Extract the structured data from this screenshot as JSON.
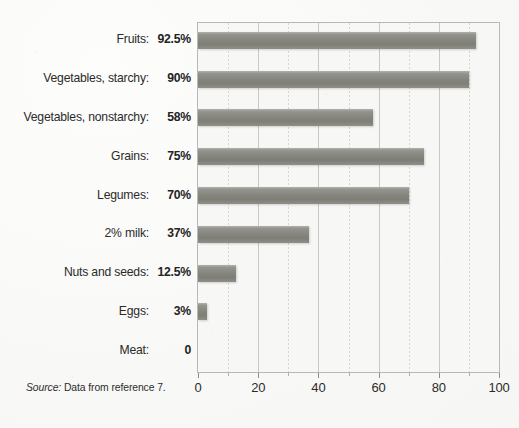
{
  "figure": {
    "source_note_lead": "Source:",
    "source_note_text": " Data from reference 7."
  },
  "axis": {
    "tick_labels": [
      "0",
      "20",
      "40",
      "60",
      "80",
      "100"
    ]
  },
  "chart_data": {
    "type": "bar",
    "orientation": "horizontal",
    "title": "",
    "xlabel": "",
    "ylabel": "",
    "xlim": [
      0,
      100
    ],
    "xticks": [
      0,
      20,
      40,
      60,
      80,
      100
    ],
    "minor_xticks": [
      10,
      30,
      50,
      70,
      90
    ],
    "grid": true,
    "legend": "none",
    "bar_color": "#87877f",
    "plot_background": "#f7f7f5",
    "categories": [
      "Fruits",
      "Vegetables, starchy",
      "Vegetables, nonstarchy",
      "Grains",
      "Legumes",
      "2% milk",
      "Nuts and seeds",
      "Eggs",
      "Meat"
    ],
    "values": [
      92.5,
      90,
      58,
      75,
      70,
      37,
      12.5,
      3,
      0
    ],
    "value_labels": [
      "92.5%",
      "90%",
      "58%",
      "75%",
      "70%",
      "37%",
      "12.5%",
      "3%",
      "0"
    ],
    "rows": [
      {
        "label": "Fruits:",
        "value": 92.5,
        "value_label": "92.5%"
      },
      {
        "label": "Vegetables, starchy:",
        "value": 90,
        "value_label": "90%"
      },
      {
        "label": "Vegetables, nonstarchy:",
        "value": 58,
        "value_label": "58%"
      },
      {
        "label": "Grains:",
        "value": 75,
        "value_label": "75%"
      },
      {
        "label": "Legumes:",
        "value": 70,
        "value_label": "70%"
      },
      {
        "label": "2% milk:",
        "value": 37,
        "value_label": "37%"
      },
      {
        "label": "Nuts and seeds:",
        "value": 12.5,
        "value_label": "12.5%"
      },
      {
        "label": "Eggs:",
        "value": 3,
        "value_label": "3%"
      },
      {
        "label": "Meat:",
        "value": 0,
        "value_label": "0"
      }
    ]
  }
}
